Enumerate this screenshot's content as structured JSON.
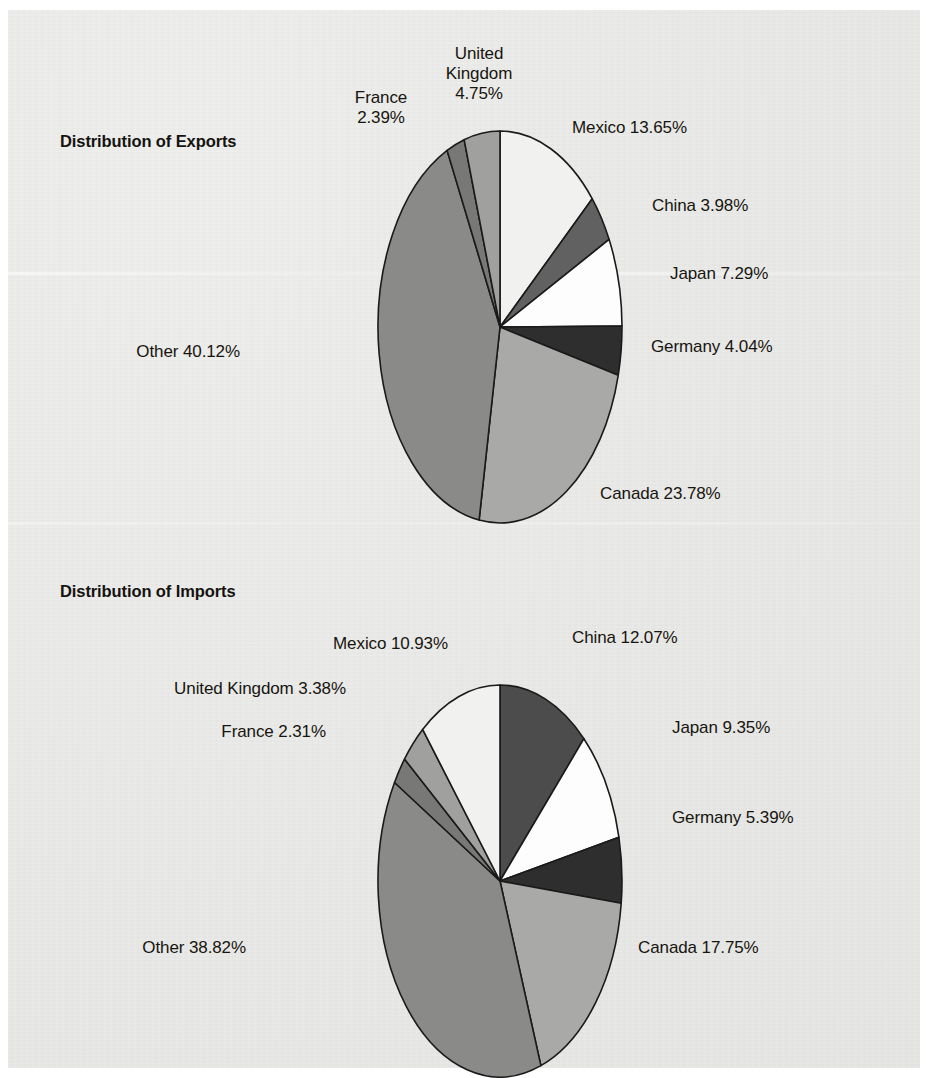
{
  "page": {
    "background_color": "#e9e9e7",
    "paper_color": "#ffffff"
  },
  "palette": {
    "mexico": "#f1f1ef",
    "china_exports": "#616161",
    "china_imports": "#4c4c4c",
    "japan": "#fdfdfd",
    "germany": "#2e2e2e",
    "canada": "#a9a9a7",
    "other": "#8a8a88",
    "france": "#787876",
    "united_kingdom": "#a0a09e",
    "outline": "#1a1a1a",
    "text": "#17150f"
  },
  "charts": [
    {
      "id": "exports",
      "title": "Distribution of Exports",
      "type": "pie",
      "categories": [
        "Mexico",
        "China",
        "Japan",
        "Germany",
        "Canada",
        "Other",
        "France",
        "United Kingdom"
      ],
      "values": [
        13.65,
        3.98,
        7.29,
        4.04,
        23.78,
        40.12,
        2.39,
        4.75
      ],
      "unit": "%",
      "labels": [
        {
          "name": "mexico",
          "text": "Mexico 13.65%",
          "align": "left"
        },
        {
          "name": "china",
          "text": "China 3.98%",
          "align": "left"
        },
        {
          "name": "japan",
          "text": "Japan 7.29%",
          "align": "left"
        },
        {
          "name": "germany",
          "text": "Germany 4.04%",
          "align": "left"
        },
        {
          "name": "canada",
          "text": "Canada 23.78%",
          "align": "left"
        },
        {
          "name": "other",
          "text": "Other 40.12%",
          "align": "right"
        },
        {
          "name": "france",
          "text": "France\n2.39%",
          "align": "center"
        },
        {
          "name": "united-kingdom",
          "text": "United\nKingdom\n4.75%",
          "align": "center"
        }
      ]
    },
    {
      "id": "imports",
      "title": "Distribution of Imports",
      "type": "pie",
      "categories": [
        "China",
        "Japan",
        "Germany",
        "Canada",
        "Other",
        "France",
        "United Kingdom",
        "Mexico"
      ],
      "values": [
        12.07,
        9.35,
        5.39,
        17.75,
        38.82,
        2.31,
        3.38,
        10.93
      ],
      "unit": "%",
      "labels": [
        {
          "name": "china",
          "text": "China 12.07%",
          "align": "left"
        },
        {
          "name": "japan",
          "text": "Japan 9.35%",
          "align": "left"
        },
        {
          "name": "germany",
          "text": "Germany 5.39%",
          "align": "left"
        },
        {
          "name": "canada",
          "text": "Canada 17.75%",
          "align": "left"
        },
        {
          "name": "other",
          "text": "Other 38.82%",
          "align": "right"
        },
        {
          "name": "france",
          "text": "France 2.31%",
          "align": "right"
        },
        {
          "name": "united-kingdom",
          "text": "United Kingdom 3.38%",
          "align": "right"
        },
        {
          "name": "mexico",
          "text": "Mexico 10.93%",
          "align": "right"
        }
      ]
    }
  ],
  "chart_data": [
    {
      "type": "pie",
      "title": "Distribution of Exports",
      "categories": [
        "Mexico",
        "China",
        "Japan",
        "Germany",
        "Canada",
        "Other",
        "France",
        "United Kingdom"
      ],
      "values": [
        13.65,
        3.98,
        7.29,
        4.04,
        23.78,
        40.12,
        2.39,
        4.75
      ],
      "unit": "percent",
      "start_angle_deg": 0,
      "direction": "clockwise",
      "legend": "none",
      "labels_position": "outside-leaderless",
      "xlabel": "",
      "ylabel": "",
      "total": 100.0
    },
    {
      "type": "pie",
      "title": "Distribution of Imports",
      "categories": [
        "China",
        "Japan",
        "Germany",
        "Canada",
        "Other",
        "France",
        "United Kingdom",
        "Mexico"
      ],
      "values": [
        12.07,
        9.35,
        5.39,
        17.75,
        38.82,
        2.31,
        3.38,
        10.93
      ],
      "unit": "percent",
      "start_angle_deg": 0,
      "direction": "clockwise",
      "legend": "none",
      "labels_position": "outside-leaderless",
      "xlabel": "",
      "ylabel": "",
      "total": 100.0
    }
  ]
}
